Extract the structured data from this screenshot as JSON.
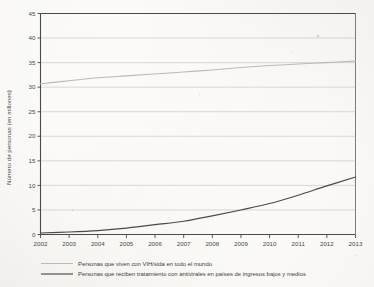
{
  "chart_data": {
    "type": "line",
    "title": "",
    "xlabel": "",
    "ylabel": "Número de personas (en millones)",
    "xlim": [
      2002,
      2013
    ],
    "ylim": [
      0,
      45
    ],
    "grid": true,
    "legend_position": "below",
    "x": [
      2002,
      2003,
      2004,
      2005,
      2006,
      2007,
      2008,
      2009,
      2010,
      2011,
      2012,
      2013
    ],
    "xticklabels": [
      "2002",
      "2003",
      "2004",
      "2005",
      "2006",
      "2007",
      "2008",
      "2009",
      "2010",
      "2011",
      "2012",
      "2013"
    ],
    "yticks": [
      0,
      5,
      10,
      15,
      20,
      25,
      30,
      35,
      40,
      45
    ],
    "yticklabels": [
      "0",
      "5",
      "10",
      "15",
      "20",
      "25",
      "30",
      "35",
      "40",
      "45"
    ],
    "series": [
      {
        "name": "Personas que viven con VIH/sida en todo el mundo",
        "color": "#b9b9b9",
        "values": [
          30.7,
          31.3,
          31.9,
          32.3,
          32.7,
          33.1,
          33.5,
          34.0,
          34.4,
          34.7,
          35.0,
          35.3
        ]
      },
      {
        "name": "Personas que reciben tratamiento con antivirales en países de ingresos bajos y medios",
        "color": "#4a4a4a",
        "values": [
          0.3,
          0.5,
          0.8,
          1.3,
          2.0,
          2.7,
          3.8,
          5.0,
          6.3,
          8.0,
          9.9,
          11.7
        ]
      }
    ]
  },
  "legend": {
    "items": [
      {
        "label": "Personas que viven con VIH/sida en todo el mundo",
        "color": "#b9b9b9"
      },
      {
        "label": "Personas que reciben tratamiento con antivirales en países de ingresos bajos y medios",
        "color": "#4a4a4a"
      }
    ]
  },
  "colors": {
    "background": "#f2f0ec",
    "axis": "#4a4a4a",
    "grid": "#c9c9c9",
    "series_light": "#b9b9b9",
    "series_dark": "#4a4a4a"
  }
}
